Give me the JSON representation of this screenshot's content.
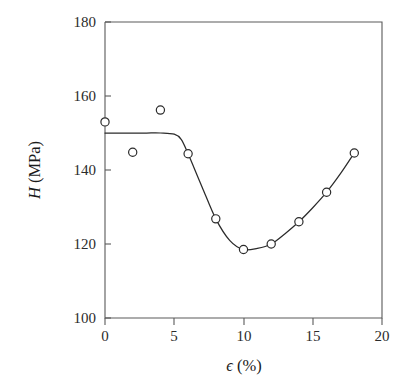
{
  "chart_data": {
    "type": "scatter",
    "title": "",
    "subtitle": "",
    "xlabel": "ϵ (%)",
    "ylabel": "H (MPa)",
    "ylabel_symbol": "H",
    "ylabel_unit": "(MPa)",
    "xlabel_symbol": "ϵ",
    "xlabel_unit": "(%)",
    "xlim": [
      0,
      20
    ],
    "ylim": [
      100,
      180
    ],
    "xticks": [
      0,
      5,
      10,
      15,
      20
    ],
    "xtick_labels": [
      "0",
      "5",
      "10",
      "15",
      "20"
    ],
    "yticks": [
      100,
      120,
      140,
      160,
      180
    ],
    "ytick_labels": [
      "100",
      "120",
      "140",
      "160",
      "180"
    ],
    "x_minor_ticks": [],
    "grid": false,
    "legend": null,
    "legend_position": "none",
    "marker_style": "open-circle",
    "marker_color": "#2b2b2b",
    "line_color": "#2b2b2b",
    "frame": "box",
    "x": [
      0,
      2,
      4,
      6,
      8,
      10,
      12,
      14,
      16,
      18
    ],
    "values": [
      153,
      144.8,
      156.2,
      144.4,
      126.8,
      118.5,
      120,
      126,
      134,
      144.6
    ],
    "series": [
      {
        "name": "H vs strain",
        "x": [
          0,
          2,
          4,
          6,
          8,
          10,
          12,
          14,
          16,
          18
        ],
        "values": [
          153,
          144.8,
          156.2,
          144.4,
          126.8,
          118.5,
          120,
          126,
          134,
          144.6
        ]
      }
    ],
    "fit_curve": {
      "description": "smooth trend line: flat plateau near 150 MPa up to about 5.5% strain, sharp drop through the 6-10% points to a minimum near 118.5 MPa at 10%, then a rising branch through the 12-18% points",
      "x": [
        0,
        1,
        2,
        3,
        4,
        5,
        5.5,
        6,
        7,
        8,
        9,
        10,
        11,
        12,
        13,
        14,
        15,
        16,
        17,
        18
      ],
      "values": [
        150,
        150,
        150,
        150,
        150,
        149.7,
        148.3,
        144.4,
        135.5,
        126.8,
        121,
        118.5,
        118.8,
        120,
        122.8,
        126,
        129.8,
        134,
        139,
        144.6
      ]
    }
  }
}
